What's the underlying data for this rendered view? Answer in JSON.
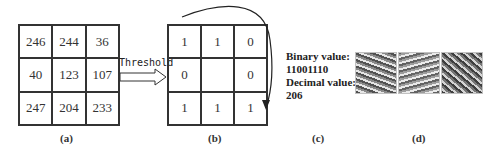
{
  "panel_a": {
    "values": [
      [
        "246",
        "244",
        "36"
      ],
      [
        "40",
        "123",
        "107"
      ],
      [
        "247",
        "204",
        "233"
      ]
    ],
    "caption": "(a)"
  },
  "arrow": {
    "label": "Threshold"
  },
  "panel_b": {
    "values": [
      [
        "1",
        "1",
        "0"
      ],
      [
        "0",
        "",
        "0"
      ],
      [
        "1",
        "1",
        "1"
      ]
    ],
    "caption": "(b)"
  },
  "panel_c": {
    "binary_label": "Binary value:",
    "binary_value": "11001110",
    "decimal_label": "Decimal value:",
    "decimal_value": "206",
    "caption": "(c)"
  },
  "panel_d": {
    "images": [
      "face-lbp-1",
      "face-lbp-2",
      "face-lbp-3"
    ],
    "caption": "(d)"
  }
}
